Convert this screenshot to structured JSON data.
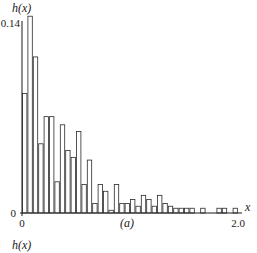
{
  "chart_data": {
    "type": "bar",
    "title": "",
    "panel_label": "(a)",
    "xlabel": "x",
    "ylabel": "h(x)",
    "next_panel_ylabel": "h(x)",
    "xlim": [
      0,
      2.0
    ],
    "ylim": [
      0,
      0.14
    ],
    "bin_width": 0.05,
    "x_ticks": [
      {
        "value": 0,
        "label": "0"
      },
      {
        "value": 2.0,
        "label": "2.0"
      }
    ],
    "y_ticks": [
      {
        "value": 0,
        "label": "0"
      },
      {
        "value": 0.14,
        "label": "0.14"
      }
    ],
    "grid": false,
    "categories": [
      "0.00",
      "0.05",
      "0.10",
      "0.15",
      "0.20",
      "0.25",
      "0.30",
      "0.35",
      "0.40",
      "0.45",
      "0.50",
      "0.55",
      "0.60",
      "0.65",
      "0.70",
      "0.75",
      "0.80",
      "0.85",
      "0.90",
      "0.95",
      "1.00",
      "1.05",
      "1.10",
      "1.15",
      "1.20",
      "1.25",
      "1.30",
      "1.35",
      "1.40",
      "1.45",
      "1.50",
      "1.55",
      "1.60",
      "1.65",
      "1.70",
      "1.75",
      "1.80",
      "1.85",
      "1.90",
      "1.95"
    ],
    "values": [
      0.088,
      0.145,
      0.115,
      0.051,
      0.071,
      0.071,
      0.023,
      0.065,
      0.046,
      0.041,
      0.06,
      0.021,
      0.039,
      0.007,
      0.021,
      0.016,
      0.002,
      0.021,
      0.007,
      0.007,
      0.01,
      0.005,
      0.013,
      0.01,
      0.005,
      0.013,
      0.007,
      0.005,
      0.0035,
      0.0035,
      0.0035,
      0.0035,
      0,
      0.0035,
      0,
      0,
      0.0035,
      0.0035,
      0,
      0.0035
    ]
  }
}
